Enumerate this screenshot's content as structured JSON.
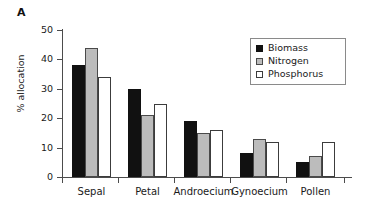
{
  "panel": {
    "letter": "A"
  },
  "legend": {
    "position": "top-right",
    "entries": [
      {
        "label": "Biomass",
        "color": "#111111",
        "swatch": "filled-black-square"
      },
      {
        "label": "Nitrogen",
        "color": "#bcbcbc",
        "swatch": "filled-gray-square"
      },
      {
        "label": "Phosphorus",
        "color": "#ffffff",
        "swatch": "open-white-square"
      }
    ]
  },
  "axes": {
    "y_title": "% allocation",
    "y_ticks": [
      "0",
      "10",
      "20",
      "30",
      "40",
      "50"
    ],
    "x_title": ""
  },
  "chart_data": {
    "type": "bar",
    "title": "",
    "subtitle": "",
    "xlabel": "",
    "ylabel": "% allocation",
    "ylim": [
      0,
      50
    ],
    "ytick_step": 10,
    "grid": false,
    "legend_position": "top-right",
    "categories": [
      "Sepal",
      "Petal",
      "Androecium",
      "Gynoecium",
      "Pollen"
    ],
    "series": [
      {
        "name": "Biomass",
        "color": "#111111",
        "values": [
          38,
          30,
          19,
          8,
          5
        ]
      },
      {
        "name": "Nitrogen",
        "color": "#bcbcbc",
        "values": [
          44,
          21,
          15,
          13,
          7
        ]
      },
      {
        "name": "Phosphorus",
        "color": "#ffffff",
        "values": [
          34,
          25,
          16,
          12,
          12
        ]
      }
    ]
  }
}
